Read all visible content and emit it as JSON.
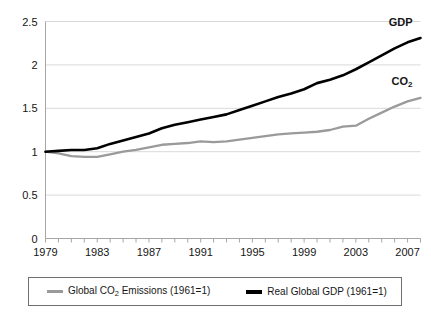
{
  "chart_data": {
    "type": "line",
    "title": "",
    "subtitle": "",
    "xlabel": "",
    "ylabel": "",
    "xlim": [
      1979,
      2008
    ],
    "ylim": [
      0,
      2.5
    ],
    "yticks": [
      "0",
      "0.5",
      "1",
      "1.5",
      "2",
      "2.5"
    ],
    "ytick_values": [
      0,
      0.5,
      1,
      1.5,
      2,
      2.5
    ],
    "xticks": [
      "1979",
      "1983",
      "1987",
      "1991",
      "1995",
      "1999",
      "2003",
      "2007"
    ],
    "xtick_values": [
      1979,
      1983,
      1987,
      1991,
      1995,
      1999,
      2003,
      2007
    ],
    "x": [
      1979,
      1980,
      1981,
      1982,
      1983,
      1984,
      1985,
      1986,
      1987,
      1988,
      1989,
      1990,
      1991,
      1992,
      1993,
      1994,
      1995,
      1996,
      1997,
      1998,
      1999,
      2000,
      2001,
      2002,
      2003,
      2004,
      2005,
      2006,
      2007,
      2008
    ],
    "grid": "horizontal",
    "legend_position": "bottom",
    "series": [
      {
        "name": "Global CO2 Emissions (1961=1)",
        "short_name": "CO2",
        "color": "#9a9a9a",
        "values": [
          1.0,
          0.98,
          0.95,
          0.94,
          0.94,
          0.97,
          1.0,
          1.02,
          1.05,
          1.08,
          1.09,
          1.1,
          1.12,
          1.11,
          1.12,
          1.14,
          1.16,
          1.18,
          1.2,
          1.21,
          1.22,
          1.23,
          1.25,
          1.29,
          1.3,
          1.38,
          1.45,
          1.52,
          1.58,
          1.62
        ]
      },
      {
        "name": "Real Global GDP (1961=1)",
        "short_name": "GDP",
        "color": "#000000",
        "values": [
          1.0,
          1.01,
          1.02,
          1.02,
          1.04,
          1.09,
          1.13,
          1.17,
          1.21,
          1.27,
          1.31,
          1.34,
          1.37,
          1.4,
          1.43,
          1.48,
          1.53,
          1.58,
          1.63,
          1.67,
          1.72,
          1.79,
          1.83,
          1.88,
          1.95,
          2.03,
          2.11,
          2.19,
          2.26,
          2.31
        ]
      }
    ],
    "annotations": [
      {
        "text": "GDP",
        "series": "gdp"
      },
      {
        "text": "CO2",
        "series": "co2"
      }
    ]
  },
  "legend": {
    "co2": {
      "prefix": "Global CO",
      "subscript": "2",
      "suffix": " Emissions (1961=1)"
    },
    "gdp": {
      "label": "Real Global GDP (1961=1)"
    }
  },
  "annotations": {
    "gdp_label": "GDP",
    "co2_label_prefix": "CO",
    "co2_label_subscript": "2"
  },
  "colors": {
    "co2_line": "#9a9a9a",
    "gdp_line": "#000000",
    "grid": "#d9d9d9",
    "axis": "#a6a6a6",
    "text": "#151515",
    "legend_border": "#6f6f6f"
  }
}
